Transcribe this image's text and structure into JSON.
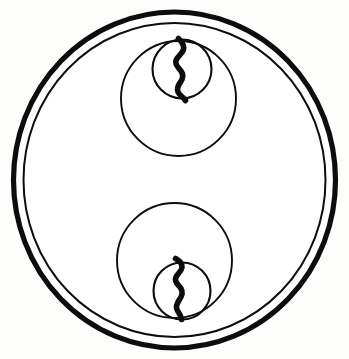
{
  "figure": {
    "description": "Line drawing: a large double-walled circle enclosing two medium circles arranged vertically; each medium circle contains a smaller circle tangent to the outer boundary, and each small circle is bisected by a thick irregular zigzag line.",
    "background_color": "#fdfdfc",
    "stroke_color": "#0d0d0d",
    "fill_color": "#ffffff",
    "canvas": {
      "width": 349,
      "height": 359
    },
    "shapes": {
      "outer_ring_outer": {
        "name": "outer-boundary-circle",
        "cx": 174.5,
        "cy": 180,
        "rx": 161,
        "ry": 168,
        "stroke_width": 5.2
      },
      "outer_ring_inner": {
        "name": "inner-boundary-circle",
        "cx": 174.5,
        "cy": 180,
        "rx": 151,
        "ry": 157,
        "stroke_width": 2.0
      },
      "upper_medium_circle": {
        "name": "upper-medium-circle",
        "cx": 178.5,
        "cy": 98.5,
        "r": 57.5,
        "stroke_width": 1.9
      },
      "upper_small_circle": {
        "name": "upper-small-circle",
        "cx": 182,
        "cy": 69,
        "r": 29.5,
        "stroke_width": 2.1
      },
      "lower_medium_circle": {
        "name": "lower-medium-circle",
        "cx": 174.5,
        "cy": 260.5,
        "r": 57.5,
        "stroke_width": 1.9
      },
      "lower_small_circle": {
        "name": "lower-small-circle",
        "cx": 182,
        "cy": 291,
        "r": 28.5,
        "stroke_width": 2.1
      }
    },
    "zigzags": {
      "upper": {
        "name": "upper-zigzag-line",
        "path": "M 178.5 38.5 C 182.5 42.5 184.5 45.5 183.5 49.5 C 182.3 54.0 177.5 56.0 176.0 60.5 C 174.6 64.8 178.5 67.5 181.0 71.0 C 183.6 74.6 183.0 78.5 180.5 82.0 C 178.2 85.3 176.5 88.5 178.0 92.0 C 179.6 95.7 183.5 97.0 185.5 100.5",
        "stroke_width": 5.6,
        "top_y": 38.5,
        "bottom_y": 100.5
      },
      "lower": {
        "name": "lower-zigzag-line",
        "path": "M 175.5 258.5 C 180.0 261.0 182.5 263.5 182.0 267.5 C 181.4 272.0 176.5 274.0 175.5 278.5 C 174.6 282.8 179.0 285.0 181.0 288.5 C 183.1 292.2 182.0 296.0 179.5 299.5 C 177.2 302.8 175.5 306.0 177.0 309.5 C 178.4 312.9 181.0 315.0 181.5 319.5",
        "stroke_width": 5.6,
        "top_y": 258.5,
        "bottom_y": 319.5
      }
    }
  }
}
